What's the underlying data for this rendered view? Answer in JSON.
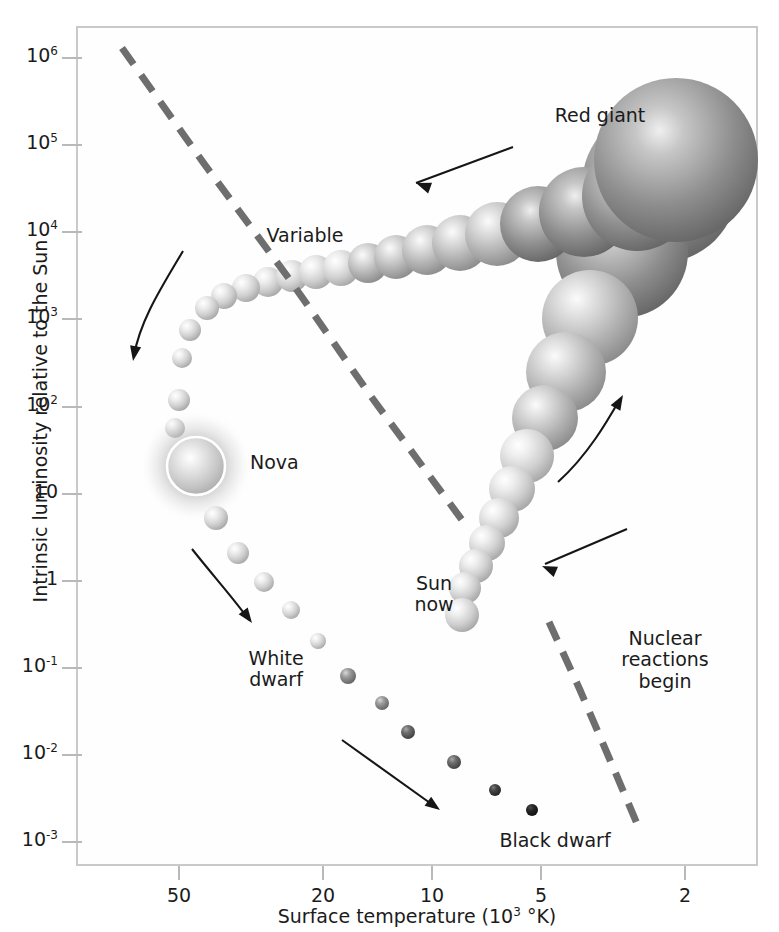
{
  "figure": {
    "type": "scatter",
    "title": "",
    "xlabel_text": "Surface temperature (10",
    "xlabel_sup": "3",
    "xlabel_tail": " °K)",
    "ylabel": "Intrinsic luminosity relative to the Sun"
  },
  "axes": {
    "x": {
      "scale": "log-reversed",
      "ticks": [
        {
          "label": "50",
          "value": 50,
          "px": 178
        },
        {
          "label": "20",
          "value": 20,
          "px": 322
        },
        {
          "label": "10",
          "value": 10,
          "px": 431
        },
        {
          "label": "5",
          "value": 5,
          "px": 540
        },
        {
          "label": "2",
          "value": 2,
          "px": 684
        }
      ],
      "range_label": "50 to 2",
      "unit": "10^3 degrees K"
    },
    "y": {
      "scale": "log",
      "ticks": [
        {
          "mantissa": "10",
          "exp": "6",
          "value": 1000000,
          "px": 57
        },
        {
          "mantissa": "10",
          "exp": "5",
          "value": 100000,
          "px": 144
        },
        {
          "mantissa": "10",
          "exp": "4",
          "value": 10000,
          "px": 231
        },
        {
          "mantissa": "10",
          "exp": "3",
          "value": 1000,
          "px": 318
        },
        {
          "mantissa": "10",
          "exp": "2",
          "value": 100,
          "px": 406
        },
        {
          "mantissa": "10",
          "exp": "",
          "value": 10,
          "px": 493
        },
        {
          "mantissa": "1",
          "exp": "",
          "value": 1,
          "px": 580
        },
        {
          "mantissa": "10",
          "exp": "-1",
          "value": 0.1,
          "px": 667
        },
        {
          "mantissa": "10",
          "exp": "-2",
          "value": 0.01,
          "px": 754
        },
        {
          "mantissa": "10",
          "exp": "-3",
          "value": 0.001,
          "px": 841
        }
      ]
    }
  },
  "annotations": [
    {
      "name": "red-giant",
      "text": "Red giant",
      "x": 600,
      "y": 105,
      "align": "center"
    },
    {
      "name": "variable",
      "text": "Variable",
      "x": 305,
      "y": 225,
      "align": "center"
    },
    {
      "name": "nova",
      "text": "Nova",
      "x": 250,
      "y": 452,
      "align": "left"
    },
    {
      "name": "sun-now",
      "text": "Sun\nnow",
      "x": 434,
      "y": 573,
      "align": "center"
    },
    {
      "name": "nuclear-reactions",
      "text": "Nuclear\nreactions\nbegin",
      "x": 665,
      "y": 628,
      "align": "center"
    },
    {
      "name": "white-dwarf",
      "text": "White\ndwarf",
      "x": 276,
      "y": 648,
      "align": "center"
    },
    {
      "name": "black-dwarf",
      "text": "Black dwarf",
      "x": 555,
      "y": 830,
      "align": "center"
    }
  ],
  "colors": {
    "frame": "#c9c9c9",
    "tick": "#b9b9b9",
    "text": "#1b1b1b",
    "dashed_track": "#6e6e6e",
    "arrow": "#161616",
    "nova_ring": "#ffffff",
    "giant_dark": "#5e5e5e",
    "star_pale": "#d9d9d9",
    "black_dwarf": "#1d1d1d"
  },
  "dashed_tracks": [
    {
      "name": "instability-strip-upper",
      "points": "122,48 205,165 290,280 370,395 462,520"
    },
    {
      "name": "instability-strip-lower",
      "points": "549,622 580,690 610,760 641,833"
    }
  ],
  "arrows": [
    {
      "name": "arrow-giant-branch-inward",
      "path": "M 513,147 L 416,183",
      "head": [
        416,
        183,
        -160
      ]
    },
    {
      "name": "arrow-post-giant-left",
      "path": "M 183,251 C 163,285 140,320 134,356",
      "head": [
        133,
        361,
        100
      ]
    },
    {
      "name": "arrow-cooling-white-dwarf",
      "path": "M 192,549 C 215,578 235,600 249,620",
      "head": [
        252,
        623,
        54
      ]
    },
    {
      "name": "arrow-cooling-black-dwarf",
      "path": "M 342,740 L 437,808",
      "head": [
        440,
        810,
        36
      ]
    },
    {
      "name": "arrow-protostar-contract",
      "path": "M 558,482 C 588,455 608,420 620,399",
      "head": [
        623,
        395,
        -60
      ]
    },
    {
      "name": "arrow-main-sequence-up",
      "path": "M 627,529 L 545,564",
      "head": [
        542,
        566,
        -157
      ]
    }
  ],
  "chart_data": {
    "type": "scatter",
    "xlabel": "Surface temperature (10^3 °K)",
    "ylabel": "Intrinsic luminosity relative to the Sun",
    "xlim": [
      60,
      1.7
    ],
    "ylim": [
      0.0008,
      2000000
    ],
    "xscale": "log-reversed",
    "yscale": "log",
    "grid": false,
    "legend": "none",
    "series": [
      {
        "name": "Protostar contraction to main sequence",
        "note": "large pale spheres descending from red giant region toward Sun-now",
        "points": [
          {
            "cx": 660,
            "cy": 185,
            "r": 78,
            "shade": "dark"
          },
          {
            "cx": 622,
            "cy": 252,
            "r": 66,
            "shade": "dark"
          },
          {
            "cx": 590,
            "cy": 318,
            "r": 48,
            "shade": "mid"
          },
          {
            "cx": 566,
            "cy": 372,
            "r": 40,
            "shade": "mid"
          },
          {
            "cx": 545,
            "cy": 418,
            "r": 33,
            "shade": "mid"
          },
          {
            "cx": 527,
            "cy": 456,
            "r": 27,
            "shade": "pale"
          },
          {
            "cx": 512,
            "cy": 489,
            "r": 23,
            "shade": "pale"
          },
          {
            "cx": 499,
            "cy": 518,
            "r": 20,
            "shade": "pale"
          },
          {
            "cx": 487,
            "cy": 543,
            "r": 18,
            "shade": "pale"
          },
          {
            "cx": 476,
            "cy": 566,
            "r": 17,
            "shade": "pale"
          },
          {
            "cx": 465,
            "cy": 588,
            "r": 16,
            "shade": "pale"
          },
          {
            "cx": 462,
            "cy": 615,
            "r": 17,
            "shade": "pale"
          }
        ]
      },
      {
        "name": "Giant branch",
        "note": "spheres growing in size rightward toward red giant",
        "points": [
          {
            "cx": 268,
            "cy": 282,
            "r": 15,
            "shade": "pale"
          },
          {
            "cx": 292,
            "cy": 276,
            "r": 16,
            "shade": "pale"
          },
          {
            "cx": 316,
            "cy": 272,
            "r": 17,
            "shade": "pale"
          },
          {
            "cx": 341,
            "cy": 268,
            "r": 18,
            "shade": "pale"
          },
          {
            "cx": 368,
            "cy": 263,
            "r": 20,
            "shade": "mid"
          },
          {
            "cx": 396,
            "cy": 257,
            "r": 22,
            "shade": "mid"
          },
          {
            "cx": 427,
            "cy": 250,
            "r": 25,
            "shade": "mid"
          },
          {
            "cx": 460,
            "cy": 243,
            "r": 28,
            "shade": "mid"
          },
          {
            "cx": 497,
            "cy": 234,
            "r": 32,
            "shade": "mid"
          },
          {
            "cx": 538,
            "cy": 224,
            "r": 38,
            "shade": "dark"
          },
          {
            "cx": 584,
            "cy": 212,
            "r": 45,
            "shade": "dark"
          },
          {
            "cx": 637,
            "cy": 196,
            "r": 55,
            "shade": "dark"
          },
          {
            "cx": 676,
            "cy": 160,
            "r": 82,
            "shade": "dark"
          }
        ]
      },
      {
        "name": "Post-giant descent (Variable to Nova)",
        "note": "shrinking pale spheres falling down-left",
        "points": [
          {
            "cx": 246,
            "cy": 288,
            "r": 14,
            "shade": "pale"
          },
          {
            "cx": 224,
            "cy": 296,
            "r": 13,
            "shade": "pale"
          },
          {
            "cx": 207,
            "cy": 308,
            "r": 12,
            "shade": "pale"
          },
          {
            "cx": 190,
            "cy": 330,
            "r": 11,
            "shade": "pale"
          },
          {
            "cx": 182,
            "cy": 358,
            "r": 10,
            "shade": "pale"
          },
          {
            "cx": 179,
            "cy": 400,
            "r": 11,
            "shade": "pale"
          },
          {
            "cx": 175,
            "cy": 428,
            "r": 10,
            "shade": "pale"
          }
        ]
      },
      {
        "name": "Nova",
        "note": "glowing sphere with white ring and diffuse halo",
        "points": [
          {
            "cx": 196,
            "cy": 466,
            "r": 29,
            "shade": "nova"
          }
        ]
      },
      {
        "name": "White dwarf cooling sequence",
        "note": "shrinking and darkening spheres descending to black dwarf",
        "points": [
          {
            "cx": 216,
            "cy": 518,
            "r": 12,
            "shade": "pale"
          },
          {
            "cx": 238,
            "cy": 553,
            "r": 11,
            "shade": "pale"
          },
          {
            "cx": 264,
            "cy": 582,
            "r": 10,
            "shade": "pale"
          },
          {
            "cx": 291,
            "cy": 610,
            "r": 9,
            "shade": "pale"
          },
          {
            "cx": 318,
            "cy": 641,
            "r": 8,
            "shade": "pale"
          },
          {
            "cx": 348,
            "cy": 676,
            "r": 8,
            "shade": "dim"
          },
          {
            "cx": 382,
            "cy": 703,
            "r": 7,
            "shade": "dim"
          },
          {
            "cx": 408,
            "cy": 732,
            "r": 7,
            "shade": "dimmer"
          },
          {
            "cx": 454,
            "cy": 762,
            "r": 7,
            "shade": "dimmer"
          },
          {
            "cx": 495,
            "cy": 790,
            "r": 6,
            "shade": "dark-dwarf"
          },
          {
            "cx": 532,
            "cy": 810,
            "r": 6,
            "shade": "black"
          }
        ]
      }
    ]
  }
}
